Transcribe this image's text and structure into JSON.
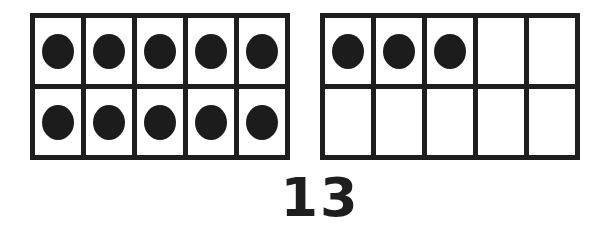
{
  "number_label": "13",
  "colors": {
    "ink": "#1e1e1e",
    "background": "#ffffff"
  },
  "frames": [
    {
      "name": "left",
      "rows": 2,
      "columns": 5,
      "filled": [
        1,
        1,
        1,
        1,
        1,
        1,
        1,
        1,
        1,
        1
      ]
    },
    {
      "name": "right",
      "rows": 2,
      "columns": 5,
      "filled": [
        1,
        1,
        1,
        0,
        0,
        0,
        0,
        0,
        0,
        0
      ]
    }
  ],
  "chart_data": {
    "type": "table",
    "frames": [
      {
        "row1": [
          "dot",
          "dot",
          "dot",
          "dot",
          "dot"
        ],
        "row2": [
          "dot",
          "dot",
          "dot",
          "dot",
          "dot"
        ],
        "count": 10
      },
      {
        "row1": [
          "dot",
          "dot",
          "dot",
          "empty",
          "empty"
        ],
        "row2": [
          "empty",
          "empty",
          "empty",
          "empty",
          "empty"
        ],
        "count": 3
      }
    ],
    "total": 13
  }
}
